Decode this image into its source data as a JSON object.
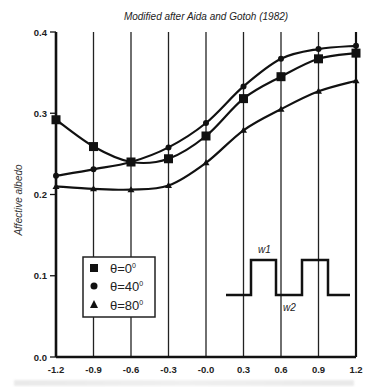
{
  "chart_data": {
    "type": "line",
    "title": "Modified after Aida and Gotoh (1982)",
    "xlabel": "",
    "ylabel": "Affective albedo",
    "xlim": [
      -1.2,
      1.2
    ],
    "ylim": [
      0.0,
      0.4
    ],
    "x": [
      -1.2,
      -0.9,
      -0.6,
      -0.3,
      0.0,
      0.3,
      0.6,
      0.9,
      1.2
    ],
    "x_tick_labels": [
      "-1.2",
      "-0.9",
      "-0.6",
      "-0.3",
      "-0.0",
      "0.3",
      "0.6",
      "0.9",
      "1.2"
    ],
    "y_ticks": [
      0.0,
      0.1,
      0.2,
      0.3,
      0.4
    ],
    "y_tick_labels": [
      "0.0",
      "0.1",
      "0.2",
      "0.3",
      "0.4"
    ],
    "grid": "vertical lines at each x tick",
    "legend_position": "lower-left inside plot",
    "series": [
      {
        "name": "θ=0°",
        "marker": "square",
        "values": [
          0.292,
          0.259,
          0.24,
          0.244,
          0.272,
          0.318,
          0.345,
          0.367,
          0.374
        ]
      },
      {
        "name": "θ=40°",
        "marker": "circle",
        "values": [
          0.223,
          0.231,
          0.24,
          0.258,
          0.288,
          0.333,
          0.367,
          0.379,
          0.383
        ]
      },
      {
        "name": "θ=80°",
        "marker": "triangle",
        "values": [
          0.21,
          0.207,
          0.206,
          0.211,
          0.239,
          0.279,
          0.305,
          0.327,
          0.34
        ]
      }
    ],
    "annotations": [
      {
        "type": "inset-square-wave",
        "labels": [
          "w1",
          "w2"
        ]
      }
    ]
  },
  "legend": {
    "items": [
      {
        "symbol": "square",
        "label_prefix": "θ=0",
        "sup": "0"
      },
      {
        "symbol": "circle",
        "label_prefix": "θ=40",
        "sup": "0"
      },
      {
        "symbol": "triangle",
        "label_prefix": "θ=80",
        "sup": "0"
      }
    ]
  },
  "inset": {
    "w1": "w1",
    "w2": "w2"
  }
}
